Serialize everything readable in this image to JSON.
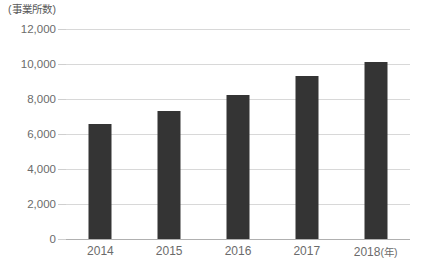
{
  "chart_data": {
    "type": "bar",
    "title": "",
    "subtitle": "",
    "xlabel": "年",
    "ylabel": "事業所数",
    "y_unit_caption": "(事業所数)",
    "x_unit_caption": "(年)",
    "categories": [
      "2014",
      "2015",
      "2016",
      "2017",
      "2018"
    ],
    "values": [
      6550,
      7300,
      8250,
      9300,
      10100
    ],
    "series": [
      {
        "name": "事業所数",
        "values": [
          6550,
          7300,
          8250,
          9300,
          10100
        ]
      }
    ],
    "ylim": [
      0,
      12000
    ],
    "ytick_values": [
      0,
      2000,
      4000,
      6000,
      8000,
      10000,
      12000
    ],
    "ytick_labels": [
      "0",
      "2,000",
      "4,000",
      "6,000",
      "8,000",
      "10,000",
      "12,000"
    ],
    "xtick_labels": [
      "2014",
      "2015",
      "2016",
      "2017",
      "2018"
    ],
    "last_xtick_suffix": "(年)",
    "grid": true,
    "legend": false,
    "legend_position": "none",
    "bar_color": "#343434",
    "gridline_color": "#d8d8d8",
    "axis_color": "#b0b0b0",
    "text_color": "#6b6b6b",
    "background_color": "#ffffff"
  }
}
